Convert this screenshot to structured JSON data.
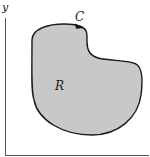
{
  "figure": {
    "type": "region-diagram",
    "axes": {
      "y_label": "y",
      "x_label": ""
    },
    "region": {
      "label": "R",
      "fill_color": "#c8c8c8",
      "stroke_color": "#1a1a1a"
    },
    "curve": {
      "label": "C",
      "orientation": "counterclockwise-arrow"
    }
  }
}
